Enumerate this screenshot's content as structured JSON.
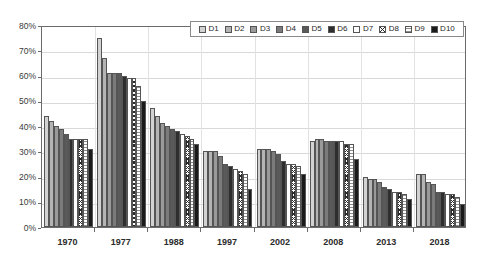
{
  "chart_data": {
    "type": "bar",
    "title": "",
    "xlabel": "",
    "ylabel": "",
    "ylim": [
      0,
      80
    ],
    "ytick_labels": [
      "80%",
      "70%",
      "60%",
      "50%",
      "40%",
      "30%",
      "20%",
      "10%",
      "0%"
    ],
    "ytick_values": [
      80,
      70,
      60,
      50,
      40,
      30,
      20,
      10,
      0
    ],
    "grid": true,
    "legend_position": "top-center",
    "categories": [
      "1970",
      "1977",
      "1988",
      "1997",
      "2002",
      "2008",
      "2013",
      "2018"
    ],
    "series": [
      {
        "name": "D1",
        "swatch": "#d2d2d2",
        "values": [
          44,
          75,
          47,
          30,
          31,
          34,
          20,
          21
        ]
      },
      {
        "name": "D2",
        "swatch": "#b4b4b4",
        "values": [
          42,
          67,
          44,
          30,
          31,
          35,
          19,
          21
        ]
      },
      {
        "name": "D3",
        "swatch": "#9a9a9a",
        "values": [
          40,
          61,
          41,
          30,
          31,
          35,
          19,
          18
        ]
      },
      {
        "name": "D4",
        "swatch": "#7b7b7b",
        "values": [
          39,
          61,
          40,
          28,
          30,
          34,
          18,
          17
        ]
      },
      {
        "name": "D5",
        "swatch": "#5a5a5a",
        "values": [
          37,
          61,
          39,
          25,
          29,
          34,
          16,
          14
        ]
      },
      {
        "name": "D6",
        "swatch": "#2e2e2e",
        "values": [
          35,
          60,
          38,
          24,
          26,
          34,
          15,
          14
        ]
      },
      {
        "name": "D7",
        "swatch": "#ffffff",
        "values": [
          35,
          59,
          37,
          23,
          25,
          34,
          14,
          13
        ]
      },
      {
        "name": "D8",
        "swatch": "hatch",
        "values": [
          35,
          59,
          36,
          22,
          25,
          33,
          14,
          13
        ]
      },
      {
        "name": "D9",
        "swatch": "dotted",
        "values": [
          35,
          56,
          35,
          21,
          24,
          33,
          13,
          12
        ]
      },
      {
        "name": "D10",
        "swatch": "#1a1a1a",
        "values": [
          31,
          50,
          33,
          15,
          21,
          27,
          11,
          9
        ]
      }
    ]
  }
}
